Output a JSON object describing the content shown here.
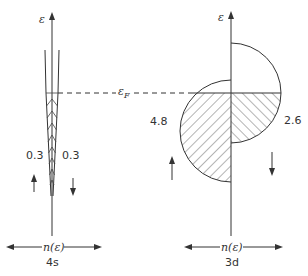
{
  "diagram": {
    "type": "density-of-states",
    "energy_axis_symbol": "ε",
    "fermi_label": "ε",
    "fermi_subscript": "F",
    "panels": [
      {
        "name": "4s",
        "label": "4s",
        "x_axis_label": "n(ε)",
        "spin_up_occupation": "0.3",
        "spin_down_occupation": "0.3"
      },
      {
        "name": "3d",
        "label": "3d",
        "x_axis_label": "n(ε)",
        "spin_up_occupation": "4.8",
        "spin_down_occupation": "2.6"
      }
    ],
    "colors": {
      "line": "#333333",
      "background": "#ffffff"
    }
  }
}
